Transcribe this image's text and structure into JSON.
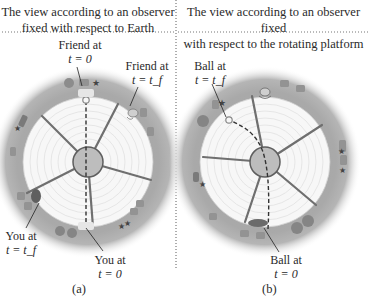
{
  "panels": [
    {
      "id": "a",
      "caption_line1": "The view according to an observer",
      "caption_line2": "fixed with respect to Earth",
      "letter": "(a)",
      "labels": {
        "friend_t0": {
          "line1": "Friend at",
          "line2": "t = 0"
        },
        "friend_tf": {
          "line1": "Friend at",
          "line2": "t = t_f"
        },
        "you_tf": {
          "line1": "You at",
          "line2": "t = t_f"
        },
        "you_t0": {
          "line1": "You at",
          "line2": "t = 0"
        }
      },
      "ball_path": "straight dashed line from You (bottom) through center to Friend's original position (top)"
    },
    {
      "id": "b",
      "caption_line1": "The view according to an observer fixed",
      "caption_line2": "with respect to the rotating platform",
      "letter": "(b)",
      "labels": {
        "ball_tf": {
          "line1": "Ball at",
          "line2": "t = t_f"
        },
        "ball_t0": {
          "line1": "Ball at",
          "line2": "t = 0"
        }
      },
      "ball_path": "curved dashed line from bottom, bending left toward upper-left"
    }
  ],
  "colors": {
    "outer_ring": "#a9a9a9",
    "disk": "#f7f7f7",
    "grid": "#d9d9d9",
    "spoke": "#6f6f6f",
    "hub": "#bdbdbd",
    "hub_stroke": "#5e5e5e",
    "divider": "#777777",
    "text": "#2a2a2a"
  }
}
